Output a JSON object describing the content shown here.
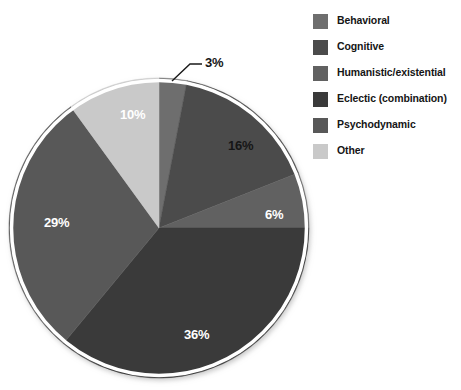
{
  "background_color": "#ffffff",
  "top_strip": {
    "text": ""
  },
  "legend": {
    "position": "right",
    "items": [
      {
        "label": "Behavioral",
        "color": "#6e6e6e"
      },
      {
        "label": "Cognitive",
        "color": "#4b4b4b"
      },
      {
        "label": "Humanistic/existential",
        "color": "#616161"
      },
      {
        "label": "Eclectic (combination)",
        "color": "#3a3a3a"
      },
      {
        "label": "Psychodynamic",
        "color": "#585858"
      },
      {
        "label": "Other",
        "color": "#c9c9c9"
      }
    ]
  },
  "pie_geometry": {
    "center_x": 159,
    "center_y": 228,
    "radius": 150,
    "rim_color": "#ffffff",
    "rim_width": 3
  },
  "labels": [
    {
      "text": "3%",
      "x": 205,
      "y": 55,
      "tone": "dark",
      "leader": true
    },
    {
      "text": "16%",
      "x": 228,
      "y": 138,
      "tone": "dark",
      "leader": false
    },
    {
      "text": "6%",
      "x": 265,
      "y": 207,
      "tone": "light",
      "leader": false
    },
    {
      "text": "36%",
      "x": 184,
      "y": 327,
      "tone": "light",
      "leader": false
    },
    {
      "text": "29%",
      "x": 44,
      "y": 215,
      "tone": "light",
      "leader": false
    },
    {
      "text": "10%",
      "x": 120,
      "y": 107,
      "tone": "light",
      "leader": false
    }
  ],
  "chart_data": {
    "type": "pie",
    "title": "",
    "subtitle": "",
    "xlabel": "",
    "ylabel": "",
    "legend_position": "right",
    "grid": false,
    "units": "percent",
    "start_angle_deg": 0,
    "direction": "clockwise",
    "categories": [
      "Behavioral",
      "Cognitive",
      "Humanistic/existential",
      "Eclectic (combination)",
      "Psychodynamic",
      "Other"
    ],
    "values": [
      3,
      16,
      6,
      36,
      29,
      10
    ],
    "value_labels": [
      "3%",
      "16%",
      "6%",
      "36%",
      "29%",
      "10%"
    ],
    "colors": [
      "#6e6e6e",
      "#4b4b4b",
      "#616161",
      "#3a3a3a",
      "#585858",
      "#c9c9c9"
    ],
    "total": 100,
    "slices": [
      {
        "name": "Behavioral",
        "value": 3,
        "label": "3%",
        "color": "#6e6e6e",
        "start_deg": 0.0,
        "end_deg": 10.8
      },
      {
        "name": "Cognitive",
        "value": 16,
        "label": "16%",
        "color": "#4b4b4b",
        "start_deg": 10.8,
        "end_deg": 68.4
      },
      {
        "name": "Humanistic/existential",
        "value": 6,
        "label": "6%",
        "color": "#616161",
        "start_deg": 68.4,
        "end_deg": 90.0
      },
      {
        "name": "Eclectic (combination)",
        "value": 36,
        "label": "36%",
        "color": "#3a3a3a",
        "start_deg": 90.0,
        "end_deg": 219.6
      },
      {
        "name": "Psychodynamic",
        "value": 29,
        "label": "29%",
        "color": "#585858",
        "start_deg": 219.6,
        "end_deg": 324.0
      },
      {
        "name": "Other",
        "value": 10,
        "label": "10%",
        "color": "#c9c9c9",
        "start_deg": 324.0,
        "end_deg": 360.0
      }
    ]
  }
}
